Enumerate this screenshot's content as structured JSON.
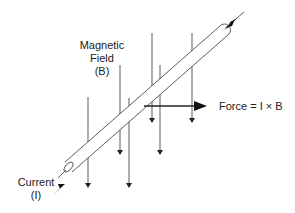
{
  "diagram": {
    "labels": {
      "field_line1": "Magnetic",
      "field_line2": "Field",
      "field_line3": "(B)",
      "force": "Force = I × B",
      "current_line1": "Current",
      "current_line2": "(I)"
    },
    "colors": {
      "line": "#222222",
      "background": "#ffffff"
    }
  }
}
